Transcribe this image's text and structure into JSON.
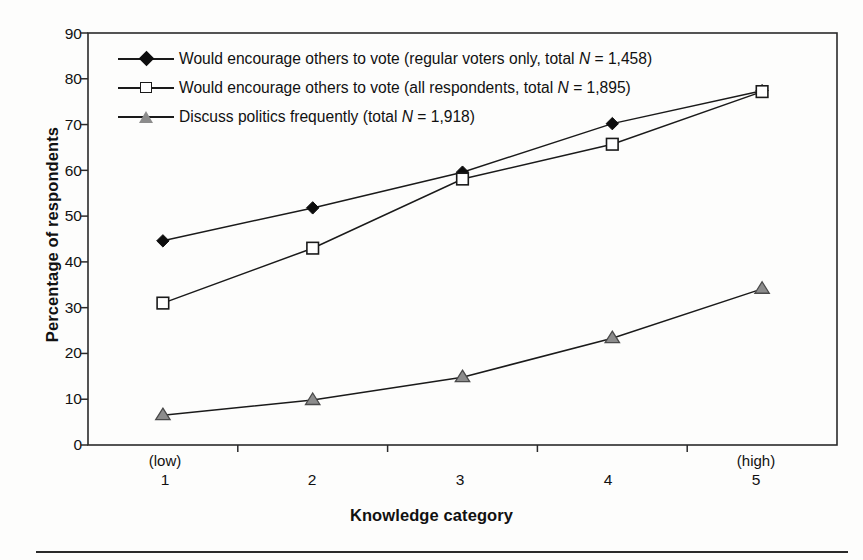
{
  "chart_data": {
    "type": "line",
    "title": "",
    "xlabel": "Knowledge category",
    "ylabel": "Percentage of respondents",
    "categories": [
      "1",
      "2",
      "3",
      "4",
      "5"
    ],
    "x_tick_notes": [
      "(low)",
      "",
      "",
      "",
      "(high)"
    ],
    "ylim": [
      0,
      90
    ],
    "ytick_step": 10,
    "yticks": [
      "90",
      "80",
      "70",
      "60",
      "50",
      "40",
      "30",
      "20",
      "10",
      "0"
    ],
    "grid": false,
    "legend_position": "top-left-inside",
    "series": [
      {
        "name": "Would encourage others to vote (regular voters only, total N = 1,458)",
        "label_plain": "Would encourage others to vote (regular voters only, total ",
        "label_italic_n": "N",
        "label_tail": " = 1,458)",
        "marker": "filled-diamond",
        "color": "#0d0d0d",
        "values": [
          44.6,
          51.8,
          59.6,
          70.2,
          77.4
        ]
      },
      {
        "name": "Would encourage others to vote (all respondents, total N = 1,895)",
        "label_plain": "Would encourage others to vote (all respondents, total ",
        "label_italic_n": "N",
        "label_tail": " = 1,895)",
        "marker": "open-square",
        "color": "#1a1a1a",
        "values": [
          31.0,
          43.0,
          58.1,
          65.7,
          77.2
        ]
      },
      {
        "name": "Discuss politics frequently (total N = 1,918)",
        "label_plain": "Discuss politics frequently (total ",
        "label_italic_n": "N",
        "label_tail": " = 1,918)",
        "marker": "grey-triangle",
        "color": "#8c8c8c",
        "values": [
          6.5,
          9.8,
          14.8,
          23.3,
          34.1
        ]
      }
    ]
  },
  "axis": {
    "y_title": "Percentage of respondents",
    "x_title": "Knowledge category",
    "y_ticks": [
      "90",
      "80",
      "70",
      "60",
      "50",
      "40",
      "30",
      "20",
      "10",
      "0"
    ],
    "x_ticks": [
      {
        "note": "(low)",
        "num": "1"
      },
      {
        "note": "",
        "num": "2"
      },
      {
        "note": "",
        "num": "3"
      },
      {
        "note": "",
        "num": "4"
      },
      {
        "note": "(high)",
        "num": "5"
      }
    ]
  },
  "legend": {
    "rows": [
      {
        "marker": "filled-diamond",
        "pre": "Would encourage others to vote (regular voters only, total ",
        "ital": "N",
        "post": " = 1,458)"
      },
      {
        "marker": "open-square",
        "pre": "Would encourage others to vote (all respondents, total ",
        "ital": "N",
        "post": " = 1,895)"
      },
      {
        "marker": "grey-triangle",
        "pre": "Discuss politics frequently (total ",
        "ital": "N",
        "post": " = 1,918)"
      }
    ]
  },
  "colors": {
    "frame": "#2a2a2a",
    "line": "#1a1a1a",
    "triangle_fill": "#8c8c8c",
    "background": "#fdfdfc"
  }
}
